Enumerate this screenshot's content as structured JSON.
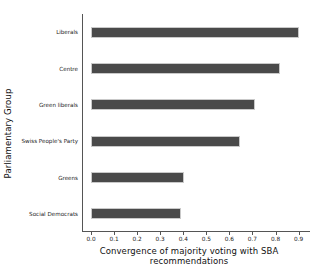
{
  "chart_data": {
    "type": "bar",
    "orientation": "horizontal",
    "title": "",
    "xlabel": "Convergence of majority voting with SBA recommendations",
    "ylabel": "Parliamentary Group",
    "categories": [
      "Liberals",
      "Centre",
      "Green liberals",
      "Swiss People's Party",
      "Greens",
      "Social Democrats"
    ],
    "values": [
      0.9,
      0.82,
      0.71,
      0.645,
      0.405,
      0.39
    ],
    "xlim": [
      0.0,
      0.945
    ],
    "xticks": [
      0.0,
      0.1,
      0.2,
      0.3,
      0.4,
      0.5,
      0.6,
      0.7,
      0.8,
      0.9
    ],
    "xtick_labels": [
      "0.0",
      "0.1",
      "0.2",
      "0.3",
      "0.4",
      "0.5",
      "0.6",
      "0.7",
      "0.8",
      "0.9"
    ],
    "grid": false,
    "legend": "none",
    "bar_color": "#4a4a4a",
    "bar_edge_color": "#c9c9c9",
    "axis_color": "#555555",
    "background": "#ffffff"
  }
}
